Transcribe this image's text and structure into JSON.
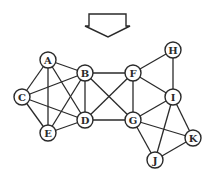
{
  "diagram": {
    "type": "graph",
    "arrow": {
      "direction": "down",
      "icon": "down-arrow-icon"
    },
    "nodes": [
      {
        "id": "A",
        "label": "A",
        "x": 48,
        "y": 60
      },
      {
        "id": "B",
        "label": "B",
        "x": 85,
        "y": 73
      },
      {
        "id": "C",
        "label": "C",
        "x": 22,
        "y": 97
      },
      {
        "id": "D",
        "label": "D",
        "x": 85,
        "y": 120
      },
      {
        "id": "E",
        "label": "E",
        "x": 48,
        "y": 133
      },
      {
        "id": "F",
        "label": "F",
        "x": 133,
        "y": 73
      },
      {
        "id": "G",
        "label": "G",
        "x": 133,
        "y": 120
      },
      {
        "id": "H",
        "label": "H",
        "x": 173,
        "y": 50
      },
      {
        "id": "I",
        "label": "I",
        "x": 173,
        "y": 97
      },
      {
        "id": "J",
        "label": "J",
        "x": 155,
        "y": 160
      },
      {
        "id": "K",
        "label": "K",
        "x": 193,
        "y": 138
      }
    ],
    "edges": [
      [
        "A",
        "B"
      ],
      [
        "A",
        "C"
      ],
      [
        "A",
        "D"
      ],
      [
        "A",
        "E"
      ],
      [
        "B",
        "C"
      ],
      [
        "B",
        "D"
      ],
      [
        "B",
        "E"
      ],
      [
        "B",
        "F"
      ],
      [
        "B",
        "G"
      ],
      [
        "C",
        "D"
      ],
      [
        "C",
        "E"
      ],
      [
        "D",
        "E"
      ],
      [
        "D",
        "F"
      ],
      [
        "D",
        "G"
      ],
      [
        "F",
        "G"
      ],
      [
        "F",
        "H"
      ],
      [
        "F",
        "I"
      ],
      [
        "H",
        "I"
      ],
      [
        "G",
        "I"
      ],
      [
        "G",
        "J"
      ],
      [
        "G",
        "K"
      ],
      [
        "I",
        "J"
      ],
      [
        "I",
        "K"
      ],
      [
        "J",
        "K"
      ]
    ]
  }
}
